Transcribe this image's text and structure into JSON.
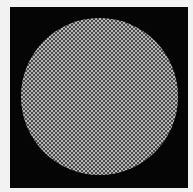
{
  "image": {
    "description": "Black square background with a large circular disc filled with a fine gray checkerboard pattern",
    "background_color": "#f2f2f2",
    "frame_color": "#050505",
    "disc": {
      "shape": "circle",
      "pattern": "checkerboard",
      "light_color": "#b4b4b4",
      "dark_color": "#4a4a4a",
      "cell_size_px": 2
    }
  }
}
